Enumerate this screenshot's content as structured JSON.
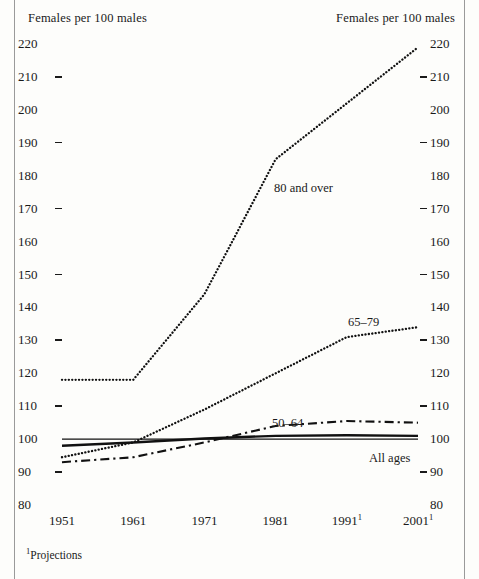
{
  "figure": {
    "left_axis_title": "Females per 100 males",
    "right_axis_title": "Females per 100 males",
    "footnote": "Projections",
    "footnote_marker": "1"
  },
  "chart_data": {
    "type": "line",
    "title": "Females per 100 males",
    "xlabel": "",
    "ylabel": "Females per 100 males",
    "ylim": [
      80,
      220
    ],
    "xlim": [
      1951,
      2001
    ],
    "grid": false,
    "legend": "inline-labels",
    "y_ticks": [
      80,
      90,
      100,
      110,
      120,
      130,
      140,
      150,
      160,
      170,
      180,
      190,
      200,
      210,
      220
    ],
    "y_ticks_with_dash": [
      90,
      110,
      130,
      150,
      170,
      190,
      210
    ],
    "x": [
      1951,
      1961,
      1971,
      1981,
      1991,
      2001
    ],
    "x_tick_labels": [
      "1951",
      "1961",
      "1971",
      "1981",
      "1991",
      "2001"
    ],
    "x_tick_footnote_marks": [
      "",
      "",
      "",
      "",
      "1",
      "1"
    ],
    "reference_line": {
      "value": 100,
      "color": "#8a8a8a"
    },
    "series": [
      {
        "name": "80 and over",
        "label": "80 and over",
        "style": "dotted",
        "values": [
          118,
          118,
          144,
          185,
          202,
          219
        ]
      },
      {
        "name": "65-79",
        "label": "65–79",
        "style": "dotted",
        "values": [
          94.5,
          99,
          109,
          120,
          131,
          134
        ]
      },
      {
        "name": "50-64",
        "label": "50–64",
        "style": "dash-dot",
        "values": [
          93,
          94.5,
          99,
          104,
          105.5,
          105
        ]
      },
      {
        "name": "All ages",
        "label": "All ages",
        "style": "solid",
        "values": [
          98,
          99,
          100.2,
          101,
          101.2,
          101
        ]
      }
    ]
  }
}
